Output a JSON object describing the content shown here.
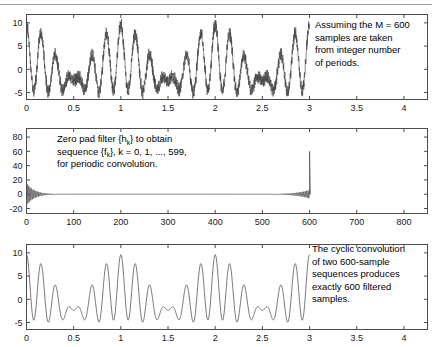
{
  "figure": {
    "title": "",
    "panel_count": 3,
    "background_color": "#ffffff",
    "trace_color": "#555555"
  },
  "chart_data": [
    {
      "type": "line",
      "id": "panel-top",
      "title": "",
      "xlabel": "",
      "ylabel": "",
      "xlim": [
        0,
        4.25
      ],
      "ylim": [
        -6.5,
        11.8
      ],
      "xticks": [
        0,
        0.5,
        1,
        1.5,
        2,
        2.5,
        3,
        3.5,
        4
      ],
      "xticklabels": [
        "0",
        "0.5",
        "1",
        "1.5",
        "2",
        "2.5",
        "3",
        "3.5",
        "4"
      ],
      "yticks": [
        -5,
        0,
        5,
        10
      ],
      "yticklabels": [
        "-5",
        "0",
        "5",
        "10"
      ],
      "grid": false,
      "legend": null,
      "series": [
        {
          "name": "noisy input signal",
          "description": "multi-tone beating waveform with additive high-frequency noise, defined on 0 to 3",
          "x_start": 0,
          "x_end": 3,
          "n_samples": 600,
          "components": [
            {
              "amplitude": 3.6,
              "cycles_over_range": 18
            },
            {
              "amplitude": 3.4,
              "cycles_over_range": 21
            },
            {
              "amplitude": 2.6,
              "cycles_over_range": 3
            }
          ],
          "noise_amplitude": 1.1,
          "y_min": -6.0,
          "y_max": 11.0
        }
      ],
      "annotation": {
        "text_lines": [
          "Assuming the M = 600",
          "samples are taken",
          "from integer number",
          "of periods."
        ],
        "x_px": 315,
        "y_px": 22
      }
    },
    {
      "type": "line",
      "id": "panel-mid",
      "title": "",
      "xlabel": "",
      "ylabel": "",
      "xlim": [
        0,
        850
      ],
      "ylim": [
        -27,
        92
      ],
      "xticks": [
        0,
        100,
        200,
        300,
        400,
        500,
        600,
        700,
        800
      ],
      "xticklabels": [
        "0",
        "100",
        "200",
        "300",
        "400",
        "500",
        "600",
        "700",
        "800"
      ],
      "yticks": [
        -20,
        0,
        20,
        40,
        60,
        80
      ],
      "yticklabels": [
        "-20",
        "0",
        "20",
        "40",
        "60",
        "80"
      ],
      "grid": false,
      "legend": null,
      "series": [
        {
          "name": "zero padded filter sequence f_k",
          "description": "sinc-like filter impulse response wrapped periodically, decaying ripples from k=0 and rising back toward k=600 with a tall narrow spike at k=600",
          "k_start": 0,
          "k_end": 599,
          "spike_position": 600,
          "spike_height": 60,
          "initial_ripple_max": 13,
          "initial_ripple_min": -19,
          "zero_region": [
            90,
            500
          ],
          "tail_ripple_amplitude": 4
        }
      ],
      "annotation": {
        "text_lines": [
          "Zero pad  filter {h_k} to obtain",
          "sequence  {f_k}, k = 0, 1, ..., 599,",
          "for periodic convolution."
        ],
        "x_px": 57,
        "y_px": 22
      }
    },
    {
      "type": "line",
      "id": "panel-bot",
      "title": "",
      "xlabel": "",
      "ylabel": "",
      "xlim": [
        0,
        4.25
      ],
      "ylim": [
        -6.5,
        11.8
      ],
      "xticks": [
        0,
        0.5,
        1,
        1.5,
        2,
        2.5,
        3,
        3.5,
        4
      ],
      "xticklabels": [
        "0",
        "0.5",
        "1",
        "1.5",
        "2",
        "2.5",
        "3",
        "3.5",
        "4"
      ],
      "yticks": [
        -5,
        0,
        5,
        10
      ],
      "yticklabels": [
        "-5",
        "0",
        "5",
        "10"
      ],
      "grid": false,
      "legend": null,
      "series": [
        {
          "name": "cyclically filtered output",
          "description": "smooth multi-tone beating waveform, noise removed, defined on 0 to 3",
          "x_start": 0,
          "x_end": 3,
          "n_samples": 600,
          "components": [
            {
              "amplitude": 3.6,
              "cycles_over_range": 18
            },
            {
              "amplitude": 3.4,
              "cycles_over_range": 21
            },
            {
              "amplitude": 2.6,
              "cycles_over_range": 3
            }
          ],
          "noise_amplitude": 0,
          "y_min": -4.4,
          "y_max": 10.0
        }
      ],
      "annotation": {
        "text_lines": [
          "The cyclic convolution",
          "of two 600-sample",
          "sequences produces",
          "exactly 600 filtered",
          "samples."
        ],
        "x_px": 312,
        "y_px": 16
      }
    }
  ]
}
